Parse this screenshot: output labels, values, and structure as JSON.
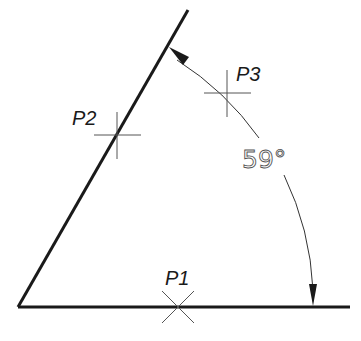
{
  "diagram": {
    "type": "angle-dimension",
    "points": [
      {
        "id": "p1",
        "label": "P1",
        "x": 178,
        "y": 307,
        "marker": "x-cross"
      },
      {
        "id": "p2",
        "label": "P2",
        "x": 117,
        "y": 135,
        "marker": "plus-cross"
      },
      {
        "id": "p3",
        "label": "P3",
        "x": 227,
        "y": 93,
        "marker": "plus-cross"
      }
    ],
    "angle_text": "59°",
    "colors": {
      "line": "#1a1a1a",
      "dimension": "#555555",
      "background": "#ffffff"
    }
  }
}
